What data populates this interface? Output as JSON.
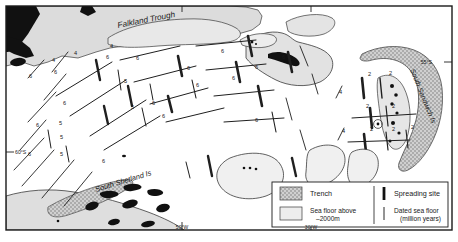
{
  "map": {
    "title": "Scotia Sea tectonic map",
    "frame": {
      "x": 6,
      "y": 6,
      "width": 446,
      "height": 224
    },
    "background_color": "#ffffff",
    "land_color": "#111111",
    "shelf_color": "#d9d9d9",
    "seafloor_color": "#efefef",
    "trench_color": "#b9b9b9",
    "line_color": "#1a1a1a"
  },
  "place_labels": [
    {
      "name": "falkland-trough-label",
      "text": "Falkland Trough",
      "x": 118,
      "y": 28,
      "rotate": -11,
      "size": 8.2,
      "style": "italic"
    },
    {
      "name": "south-shetland-is-label",
      "text": "South Shetland Is",
      "x": 96,
      "y": 192,
      "rotate": -17,
      "size": 7.4,
      "style": "italic"
    },
    {
      "name": "south-sandwich-is-label",
      "text": "South Sandwich Is",
      "x": 410,
      "y": 70,
      "rotate": 68,
      "size": 7.0,
      "style": "italic"
    }
  ],
  "graticule_labels": [
    {
      "name": "lat-label-left-60s",
      "text": "60°S",
      "x": 10,
      "y": 155,
      "size": 5.2
    },
    {
      "name": "lat-label-right-55s",
      "text": "55°S",
      "x": 437,
      "y": 66,
      "size": 5.2
    },
    {
      "name": "lon-label-bottom-50w",
      "text": "50°W",
      "x": 178,
      "y": 231,
      "size": 5.0
    },
    {
      "name": "lon-label-bottom-30w",
      "text": "30°W",
      "x": 307,
      "y": 231,
      "size": 5.0
    }
  ],
  "age_labels": [
    {
      "value": "4",
      "x": 52,
      "y": 62
    },
    {
      "value": "6",
      "x": 29,
      "y": 78
    },
    {
      "value": "6",
      "x": 54,
      "y": 74
    },
    {
      "value": "4",
      "x": 74,
      "y": 55
    },
    {
      "value": "6",
      "x": 106,
      "y": 59
    },
    {
      "value": "4",
      "x": 110,
      "y": 48
    },
    {
      "value": "6",
      "x": 136,
      "y": 60
    },
    {
      "value": "6",
      "x": 63,
      "y": 105
    },
    {
      "value": "5",
      "x": 124,
      "y": 83
    },
    {
      "value": "5",
      "x": 131,
      "y": 109
    },
    {
      "value": "6",
      "x": 152,
      "y": 105
    },
    {
      "value": "6",
      "x": 162,
      "y": 118
    },
    {
      "value": "6",
      "x": 196,
      "y": 87
    },
    {
      "value": "6",
      "x": 187,
      "y": 70
    },
    {
      "value": "6",
      "x": 232,
      "y": 80
    },
    {
      "value": "6",
      "x": 221,
      "y": 53
    },
    {
      "value": "6",
      "x": 36,
      "y": 127
    },
    {
      "value": "6",
      "x": 28,
      "y": 156
    },
    {
      "value": "5",
      "x": 60,
      "y": 139
    },
    {
      "value": "5",
      "x": 60,
      "y": 156
    },
    {
      "value": "5",
      "x": 59,
      "y": 125
    },
    {
      "value": "6",
      "x": 102,
      "y": 163
    },
    {
      "value": "6",
      "x": 255,
      "y": 69
    },
    {
      "value": "6",
      "x": 255,
      "y": 122
    },
    {
      "value": "6",
      "x": 282,
      "y": 59
    },
    {
      "value": "4",
      "x": 339,
      "y": 94
    },
    {
      "value": "4",
      "x": 342,
      "y": 133
    },
    {
      "value": "2",
      "x": 368,
      "y": 76
    },
    {
      "value": "2",
      "x": 389,
      "y": 75
    },
    {
      "value": "2",
      "x": 366,
      "y": 108
    },
    {
      "value": "2",
      "x": 392,
      "y": 108
    },
    {
      "value": "2",
      "x": 370,
      "y": 131
    },
    {
      "value": "2",
      "x": 392,
      "y": 131
    },
    {
      "value": "2",
      "x": 411,
      "y": 129
    }
  ],
  "legend": {
    "name": "map-legend",
    "box": {
      "x": 272,
      "y": 182,
      "width": 176,
      "height": 45
    },
    "entries": [
      {
        "name": "legend-trench",
        "swatch": "trench",
        "label": "Trench"
      },
      {
        "name": "legend-sea-floor",
        "swatch": "seafloor",
        "label": "Sea floor above\n–2000m"
      },
      {
        "name": "legend-spreading-site",
        "swatch": "bar-thick",
        "label": "Spreading site"
      },
      {
        "name": "legend-dated-sea-floor",
        "swatch": "bar-thin",
        "label": "Dated sea floor\n   (million years)"
      }
    ]
  }
}
